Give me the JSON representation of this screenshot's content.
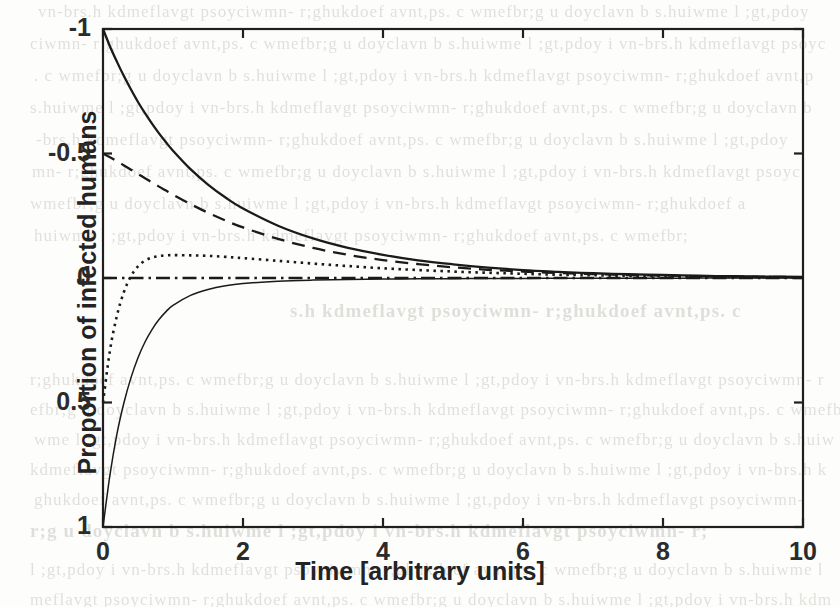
{
  "document": {
    "kind": "scanned-journal-page-figure",
    "background_text_visible": false
  },
  "figure": {
    "axis_box": {
      "left_px": 103,
      "top_px": 29,
      "right_px": 803,
      "bottom_px": 527
    },
    "xlabel": "Time [arbitrary units]",
    "ylabel": "Proportion of infected humans",
    "xticks": [
      "0",
      "2",
      "4",
      "6",
      "8",
      "10"
    ],
    "yticks": [
      "1",
      "0.5",
      "0",
      "-0.5",
      "-1"
    ],
    "axis_color": "#1f1f1f",
    "curve_color": "#1a1a1a"
  },
  "chart_data": {
    "type": "line",
    "title": "",
    "xlabel": "Time [arbitrary units]",
    "ylabel": "Proportion of infected humans",
    "xlim": [
      0,
      10
    ],
    "ylim": [
      -1,
      1
    ],
    "xticks": [
      0,
      2,
      4,
      6,
      8,
      10
    ],
    "yticks": [
      -1,
      -0.5,
      0,
      0.5,
      1
    ],
    "grid": false,
    "legend": "none",
    "x": [
      0,
      0.1,
      0.2,
      0.3,
      0.4,
      0.5,
      0.6,
      0.7,
      0.8,
      0.9,
      1,
      1.25,
      1.5,
      1.75,
      2,
      2.5,
      3,
      3.5,
      4,
      4.5,
      5,
      5.5,
      6,
      6.5,
      7,
      7.5,
      8,
      8.5,
      9,
      9.5,
      10
    ],
    "series": [
      {
        "name": "curve-1",
        "style": "solid",
        "initial_value": 1.0,
        "values": [
          1.0,
          0.93,
          0.868,
          0.81,
          0.757,
          0.707,
          0.662,
          0.62,
          0.581,
          0.545,
          0.511,
          0.437,
          0.375,
          0.323,
          0.279,
          0.21,
          0.159,
          0.121,
          0.093,
          0.071,
          0.055,
          0.042,
          0.032,
          0.025,
          0.019,
          0.015,
          0.012,
          0.009,
          0.007,
          0.0055,
          0.004
        ]
      },
      {
        "name": "curve-2",
        "style": "dashed",
        "initial_value": 0.5,
        "values": [
          0.5,
          0.485,
          0.469,
          0.452,
          0.435,
          0.418,
          0.401,
          0.384,
          0.367,
          0.351,
          0.335,
          0.297,
          0.262,
          0.231,
          0.203,
          0.157,
          0.121,
          0.093,
          0.072,
          0.056,
          0.043,
          0.033,
          0.026,
          0.02,
          0.016,
          0.012,
          0.0095,
          0.0074,
          0.0058,
          0.0045,
          0.0035
        ]
      },
      {
        "name": "curve-3",
        "style": "dotted",
        "initial_value": -0.5,
        "peak_value": 0.092,
        "peak_time": 1.5,
        "values": [
          -0.5,
          -0.29,
          -0.15,
          -0.055,
          0.008,
          0.047,
          0.07,
          0.082,
          0.088,
          0.091,
          0.092,
          0.091,
          0.089,
          0.085,
          0.08,
          0.069,
          0.058,
          0.048,
          0.039,
          0.032,
          0.026,
          0.021,
          0.017,
          0.013,
          0.011,
          0.0085,
          0.0068,
          0.0054,
          0.0043,
          0.0034,
          0.0027
        ]
      },
      {
        "name": "curve-4",
        "style": "dash-dot",
        "initial_value": 0.0,
        "values": [
          0,
          0,
          0,
          0,
          0,
          0,
          0,
          0,
          0,
          0,
          0,
          0,
          0,
          0,
          0,
          0,
          0,
          0,
          0,
          0,
          0,
          0,
          0,
          0,
          0,
          0,
          0,
          0,
          0,
          0,
          0
        ]
      },
      {
        "name": "curve-5",
        "style": "solid-thin",
        "initial_value": -1.0,
        "values": [
          -1.0,
          -0.79,
          -0.625,
          -0.5,
          -0.4,
          -0.32,
          -0.257,
          -0.207,
          -0.167,
          -0.135,
          -0.11,
          -0.07,
          -0.046,
          -0.031,
          -0.022,
          -0.013,
          -0.0085,
          -0.006,
          -0.0045,
          -0.0034,
          -0.0026,
          -0.002,
          -0.0016,
          -0.0013,
          -0.001,
          -0.0008,
          -0.0006,
          -0.0005,
          -0.0004,
          -0.0003,
          -0.0002
        ]
      }
    ]
  }
}
